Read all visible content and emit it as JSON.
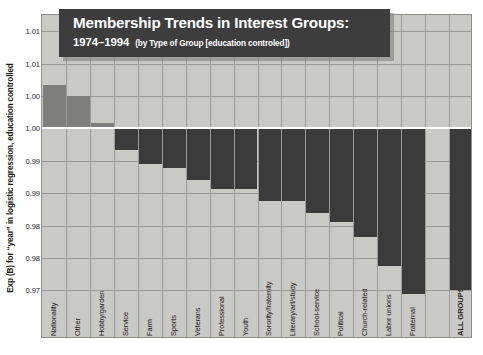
{
  "chart_data": {
    "type": "bar",
    "title": "Membership Trends in Interest Groups:",
    "title_years": "1974–1994",
    "subtitle": "(by Type of Group [education controled])",
    "xlabel": "",
    "ylabel": "Exp (B) for “year” in logistic regression, education controlled",
    "baseline": 1.0,
    "ylim": [
      0.9675,
      1.0175
    ],
    "grid": true,
    "legend": "none",
    "ytick_values": [
      1.015,
      1.01,
      1.005,
      1.0,
      0.995,
      0.99,
      0.985,
      0.98,
      0.975
    ],
    "ytick_labels": [
      "1.01",
      "1.01",
      "1.00",
      "1.00",
      "0.99",
      "0.99",
      "0.98",
      "0.98",
      "0.97"
    ],
    "categories": [
      "Nationality",
      "Other",
      "Hobby/garden",
      "Service",
      "Farm",
      "Sports",
      "Veterans",
      "Professional",
      "Youth",
      "Sorority/fraternity",
      "Literary/art/study",
      "School-service",
      "Political",
      "Church-related",
      "Labor unions",
      "Fraternal",
      "",
      "ALL GROUPS"
    ],
    "values": [
      1.0067,
      1.005,
      1.0008,
      0.9967,
      0.9945,
      0.9939,
      0.9921,
      0.9906,
      0.9906,
      0.9888,
      0.9888,
      0.987,
      0.9855,
      0.9833,
      0.9788,
      0.9745,
      null,
      0.9751
    ],
    "value_labels": [
      "1.007",
      "1.005",
      "1.001",
      "0.997",
      "0.995",
      "0.994",
      "0.992",
      "0.991",
      "0.991",
      "0.989",
      "0.989",
      "0.987",
      "0.986",
      "0.983",
      "0.979",
      "0.975",
      "",
      "0.975"
    ],
    "colors": {
      "positive_bar": "#7e7e7c",
      "negative_bar": "#3b3b3b",
      "plot_background": "#c9c9c5",
      "gridline": "#9a9a96",
      "baseline": "#ffffff",
      "title_banner": "#3d3d3d",
      "title_text": "#ffffff"
    }
  }
}
